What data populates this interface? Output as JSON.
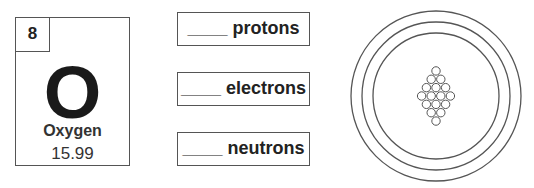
{
  "element_card": {
    "atomic_number": "8",
    "symbol": "O",
    "name": "Oxygen",
    "atomic_mass": "15.99"
  },
  "labels": [
    {
      "blank": "____",
      "text": "protons"
    },
    {
      "blank": "____",
      "text": "electrons"
    },
    {
      "blank": "____",
      "text": "neutrons"
    }
  ],
  "atom_diagram": {
    "shells": 3,
    "nucleus_rows": [
      1,
      2,
      3,
      4,
      3,
      2,
      1
    ],
    "nucleus_particle_count": 16,
    "stroke_color": "#555555"
  }
}
